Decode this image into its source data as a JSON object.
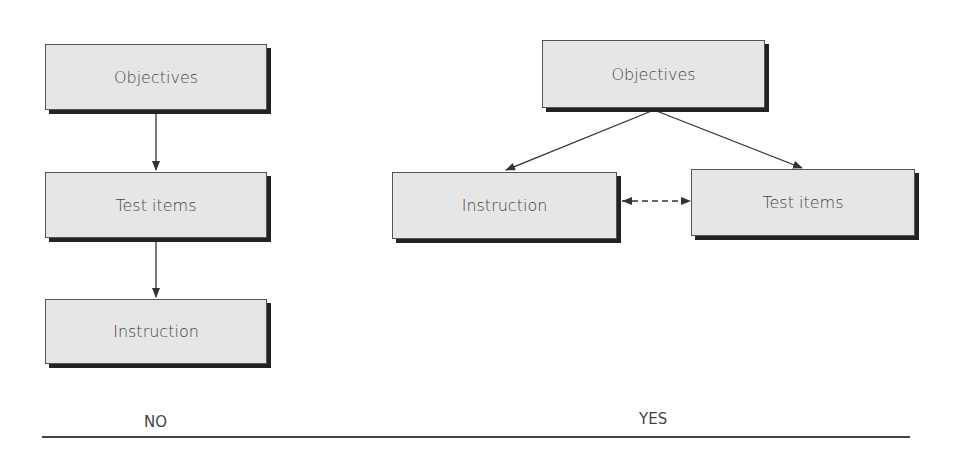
{
  "left_diagram": {
    "boxes": [
      "Objectives",
      "Test items",
      "Instruction"
    ],
    "caption": "NO"
  },
  "right_diagram": {
    "boxes": [
      "Objectives",
      "Instruction",
      "Test items"
    ],
    "caption": "YES"
  }
}
